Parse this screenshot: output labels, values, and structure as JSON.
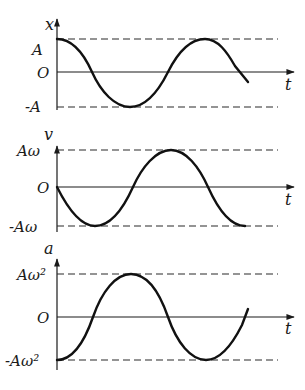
{
  "figure": {
    "colors": {
      "ink": "#111111",
      "background": "#ffffff"
    },
    "panels": [
      {
        "id": "displacement",
        "y_axis_label": "x",
        "x_axis_label": "t",
        "origin_label": "O",
        "max_label": "A",
        "min_label": "-A",
        "function": "cos",
        "phase_note": "x = A cos(ωt)"
      },
      {
        "id": "velocity",
        "y_axis_label": "v",
        "x_axis_label": "t",
        "origin_label": "O",
        "max_label": "Aω",
        "min_label": "-Aω",
        "function": "-sin",
        "phase_note": "v = -Aω sin(ωt)"
      },
      {
        "id": "acceleration",
        "y_axis_label": "a",
        "x_axis_label": "t",
        "origin_label": "O",
        "max_label": "Aω²",
        "min_label": "-Aω²",
        "function": "-cos",
        "phase_note": "a = -Aω² cos(ωt)"
      }
    ]
  }
}
